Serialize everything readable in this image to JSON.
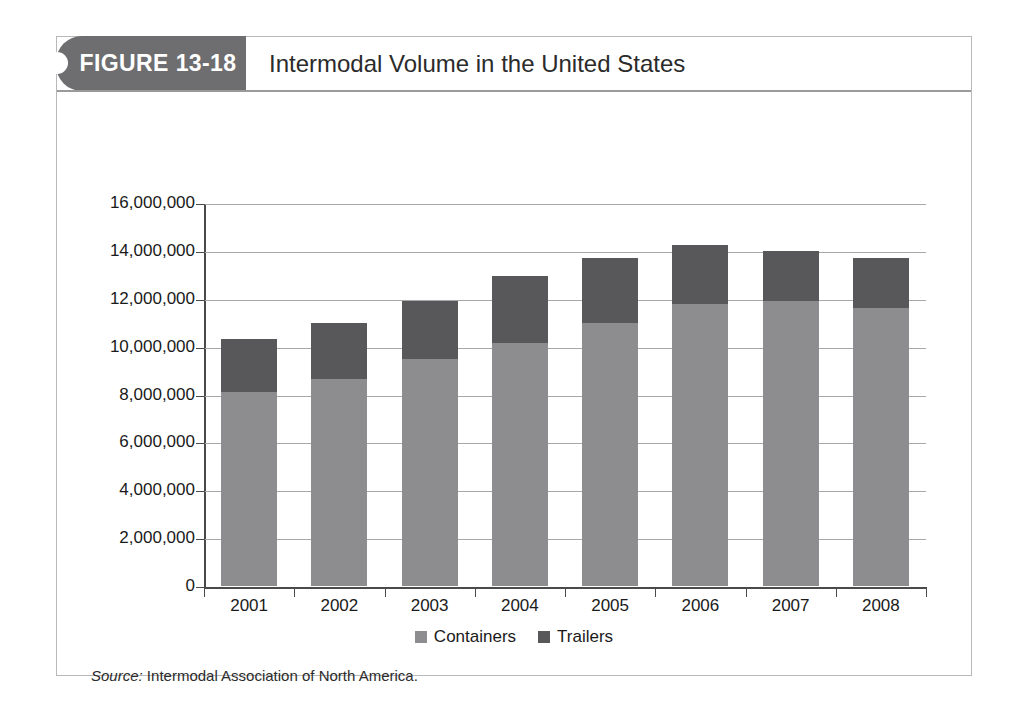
{
  "figure": {
    "tab_label": "FIGURE 13-18",
    "title": "Intermodal Volume in the United States",
    "source_label": "Source:",
    "source_text": " Intermodal Association of North America."
  },
  "colors": {
    "containers": "#8d8d8f",
    "trailers": "#58585a",
    "tab_background": "#6e6e70",
    "gridline": "#a8a8a8",
    "axis": "#4a4a4a",
    "frame_border": "#b9b9b9"
  },
  "chart_data": {
    "type": "bar",
    "stacked": true,
    "title": "Intermodal Volume in the United States",
    "xlabel": "",
    "ylabel": "",
    "categories": [
      "2001",
      "2002",
      "2003",
      "2004",
      "2005",
      "2006",
      "2007",
      "2008"
    ],
    "series": [
      {
        "name": "Containers",
        "color": "#8d8d8f",
        "values": [
          8100000,
          8650000,
          9500000,
          10150000,
          11000000,
          11800000,
          11900000,
          11600000
        ]
      },
      {
        "name": "Trailers",
        "color": "#58585a",
        "values": [
          2200000,
          2350000,
          2400000,
          2800000,
          2700000,
          2450000,
          2100000,
          2100000
        ]
      }
    ],
    "totals": [
      10300000,
      11000000,
      11900000,
      12950000,
      13700000,
      14250000,
      14000000,
      13700000
    ],
    "ylim": [
      0,
      16000000
    ],
    "ytick_step": 2000000,
    "yticks": [
      0,
      2000000,
      4000000,
      6000000,
      8000000,
      10000000,
      12000000,
      14000000,
      16000000
    ],
    "ytick_labels": [
      "0",
      "2,000,000",
      "4,000,000",
      "6,000,000",
      "8,000,000",
      "10,000,000",
      "12,000,000",
      "14,000,000",
      "16,000,000"
    ],
    "grid": true,
    "legend_position": "bottom",
    "legend": [
      "Containers",
      "Trailers"
    ]
  }
}
